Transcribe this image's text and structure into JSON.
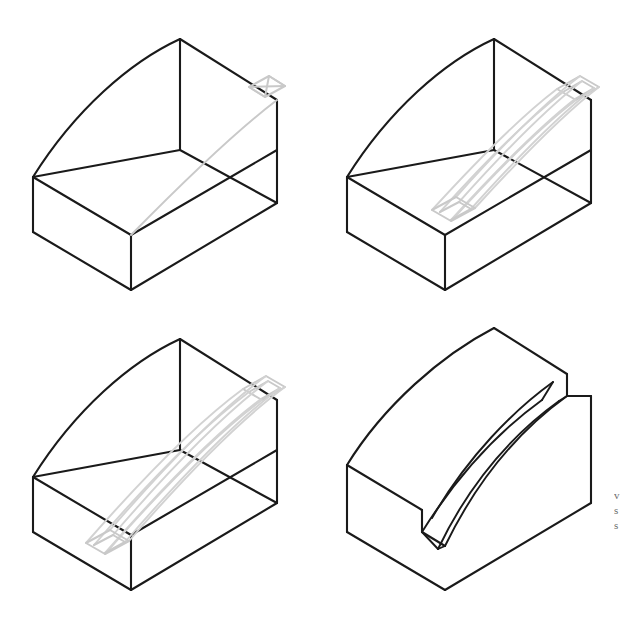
{
  "figure": {
    "background_color": "#ffffff",
    "solid_line_color": "#1a1a1a",
    "sketch_line_color": "#c9c9c9",
    "width_px": 628,
    "height_px": 631,
    "panel_count": 4,
    "layout": "2x2 grid"
  },
  "panels": [
    {
      "id": "panel-1",
      "index": "1",
      "caption": "",
      "step_label": "Block outline with sweep path and start profile",
      "geometry": "isometric wireframe block with curved top-left face",
      "sketch_elements": "profile parallelogram at upper right face, single curved sweep path across floor",
      "position": "top-left"
    },
    {
      "id": "panel-2",
      "index": "2",
      "caption": "",
      "step_label": "Partial swept channel along path",
      "geometry": "isometric wireframe block with curved top-left face",
      "sketch_elements": "U-channel profile swept part way down the curved path",
      "position": "top-right"
    },
    {
      "id": "panel-3",
      "index": "3",
      "caption": "",
      "step_label": "Swept channel extended to far end",
      "geometry": "isometric wireframe block with curved top-left face",
      "sketch_elements": "U-channel profile swept fully across the block floor",
      "position": "bottom-left"
    },
    {
      "id": "panel-4",
      "index": "4",
      "caption": "",
      "step_label": "Resulting solid with curved groove",
      "geometry": "solid isometric wedge with stepped face and curved groove",
      "sketch_elements": "none",
      "position": "bottom-right"
    }
  ],
  "margin": {
    "marks": [
      "v",
      "s",
      "s"
    ]
  }
}
